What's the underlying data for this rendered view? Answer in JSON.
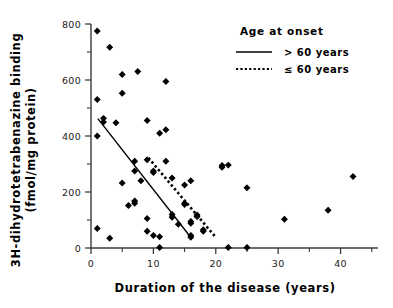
{
  "chart_data": {
    "type": "scatter",
    "title": "",
    "xlabel": "Duration of the disease (years)",
    "ylabel_line1": "3H-dihydrotetrabenazine binding",
    "ylabel_line2": "(fmol/mg protein)",
    "xlim": [
      0,
      46
    ],
    "ylim": [
      0,
      800
    ],
    "xticks": [
      0,
      10,
      20,
      30,
      40
    ],
    "xticklabels": [
      "0",
      "10",
      "20",
      "30",
      "40"
    ],
    "xminorticks": [
      5,
      15,
      25,
      35,
      45
    ],
    "yticks": [
      0,
      200,
      400,
      600,
      800
    ],
    "yticklabels": [
      "0",
      "200",
      "400",
      "600",
      "800"
    ],
    "yminorticks": [
      100,
      300,
      500,
      700
    ],
    "grid": false,
    "marker": "filled-diamond",
    "marker_color": "#000000",
    "points": [
      [
        1,
        775
      ],
      [
        1,
        530
      ],
      [
        1,
        400
      ],
      [
        1,
        70
      ],
      [
        2,
        463
      ],
      [
        2,
        450
      ],
      [
        3,
        717
      ],
      [
        3,
        35
      ],
      [
        4,
        447
      ],
      [
        5,
        620
      ],
      [
        5,
        553
      ],
      [
        5,
        232
      ],
      [
        6,
        152
      ],
      [
        7,
        310
      ],
      [
        7,
        275
      ],
      [
        7,
        168
      ],
      [
        7,
        160
      ],
      [
        7.5,
        630
      ],
      [
        8,
        240
      ],
      [
        9,
        455
      ],
      [
        9,
        315
      ],
      [
        9,
        105
      ],
      [
        9,
        60
      ],
      [
        10,
        275
      ],
      [
        10,
        270
      ],
      [
        10,
        45
      ],
      [
        11,
        410
      ],
      [
        11,
        40
      ],
      [
        11,
        2
      ],
      [
        12,
        595
      ],
      [
        12,
        422
      ],
      [
        12,
        310
      ],
      [
        13,
        250
      ],
      [
        13,
        120
      ],
      [
        13,
        110
      ],
      [
        14,
        85
      ],
      [
        15,
        225
      ],
      [
        15,
        160
      ],
      [
        15,
        155
      ],
      [
        16,
        240
      ],
      [
        16,
        95
      ],
      [
        16,
        88
      ],
      [
        16,
        45
      ],
      [
        16,
        38
      ],
      [
        17,
        118
      ],
      [
        17,
        112
      ],
      [
        18,
        65
      ],
      [
        18,
        60
      ],
      [
        21,
        295
      ],
      [
        21,
        288
      ],
      [
        22,
        296
      ],
      [
        22,
        2
      ],
      [
        25,
        215
      ],
      [
        25,
        2
      ],
      [
        31,
        103
      ],
      [
        38,
        135
      ],
      [
        42,
        255
      ]
    ],
    "lines": [
      {
        "name": "over-60-regression",
        "style": "solid",
        "x0": 1.1,
        "y0": 462,
        "x1": 16.2,
        "y1": 32
      },
      {
        "name": "under-60-regression",
        "style": "dotted",
        "x0": 9.2,
        "y0": 322,
        "x1": 20.0,
        "y1": 38
      }
    ],
    "legend": {
      "position": "top-right",
      "title": "Age at onset",
      "entries": [
        {
          "style": "solid",
          "label": "> 60 years"
        },
        {
          "style": "dotted",
          "label": "≤ 60 years"
        }
      ]
    }
  }
}
